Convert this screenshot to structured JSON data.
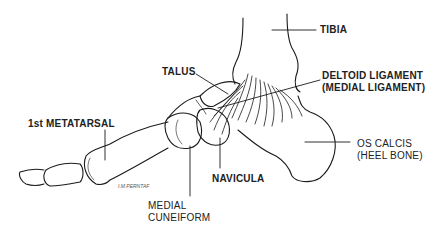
{
  "diagram": {
    "labels": {
      "tibia": "TIBIA",
      "talus": "TALUS",
      "deltoid_line1": "DELTOID LIGAMENT",
      "deltoid_line2": "(MEDIAL LIGAMENT)",
      "first_metatarsal": "1st METATARSAL",
      "os_calcis_line1": "OS CALCIS",
      "os_calcis_line2": "(HEEL BONE)",
      "navicula": "NAVICULA",
      "medial_cuneiform_line1": "MEDIAL",
      "medial_cuneiform_line2": "CUNEIFORM"
    },
    "signature": "I.M.PERNTAF",
    "colors": {
      "ink": "#1a1a1a",
      "background": "#ffffff"
    }
  }
}
